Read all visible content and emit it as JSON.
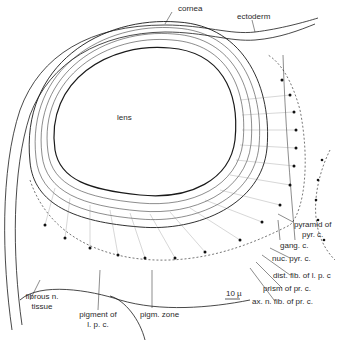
{
  "figure": {
    "type": "histological illustration",
    "colors": {
      "ink": "#1a1a1a",
      "background": "#ffffff",
      "fiber": "#555555"
    }
  },
  "labels": {
    "cornea": "cornea",
    "ectoderm": "ectoderm",
    "lens": "lens",
    "pyramid_of_pyr_c_line1": "pyramid of",
    "pyramid_of_pyr_c_line2": "pyr. c.",
    "gang_c": "gang. c.",
    "nuc_pyr_c": "nuc. pyr. c.",
    "dist_fib": "dist. fib. of l. p. c",
    "prism": "prism of pr. c.",
    "ax_n_fib": "ax. n. fib. of pr. c.",
    "fibrous_line1": "fibrous n.",
    "fibrous_line2": "tissue",
    "pigment_line1": "pigment of",
    "pigment_line2": "l. p. c.",
    "pigm_zone": "pigm. zone",
    "scale_bar": "10 µ"
  }
}
